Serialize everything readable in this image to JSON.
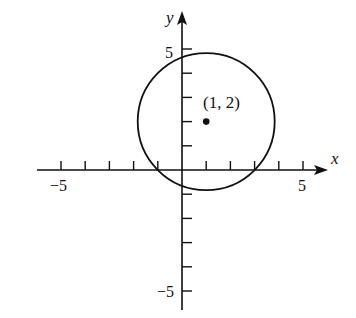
{
  "diagram": {
    "type": "coordinate-plane",
    "axes": {
      "x_label": "x",
      "y_label": "y",
      "x_range": [
        -6,
        6
      ],
      "y_range": [
        -6,
        6
      ],
      "x_tick_labels": [
        {
          "value": -5,
          "text": "−5"
        },
        {
          "value": 5,
          "text": "5"
        }
      ],
      "y_tick_labels": [
        {
          "value": 5,
          "text": "5"
        },
        {
          "value": -5,
          "text": "−5"
        }
      ],
      "tick_step": 1
    },
    "circle": {
      "center": [
        1,
        2
      ],
      "radius": 2.83
    },
    "point": {
      "coords": [
        1,
        2
      ],
      "label": "(1, 2)"
    },
    "colors": {
      "ink": "#111111",
      "background": "#ffffff"
    }
  }
}
